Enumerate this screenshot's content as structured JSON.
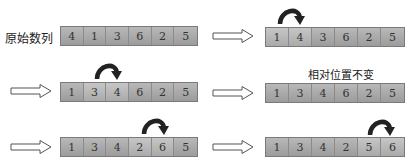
{
  "labels": {
    "original": "原始数列",
    "relative": "相对位置不变"
  },
  "steps": [
    {
      "id": "s0",
      "values": [
        "4",
        "1",
        "3",
        "6",
        "2",
        "5"
      ],
      "swap_arrow_over": null
    },
    {
      "id": "s1",
      "values": [
        "1",
        "4",
        "3",
        "6",
        "2",
        "5"
      ],
      "swap_arrow_over": [
        0,
        1
      ]
    },
    {
      "id": "s2",
      "values": [
        "1",
        "3",
        "4",
        "6",
        "2",
        "5"
      ],
      "swap_arrow_over": [
        1,
        2
      ]
    },
    {
      "id": "s3",
      "values": [
        "1",
        "3",
        "4",
        "6",
        "2",
        "5"
      ],
      "swap_arrow_over": null
    },
    {
      "id": "s4",
      "values": [
        "1",
        "3",
        "4",
        "2",
        "6",
        "5"
      ],
      "swap_arrow_over": [
        3,
        4
      ]
    },
    {
      "id": "s5",
      "values": [
        "1",
        "3",
        "4",
        "2",
        "5",
        "6"
      ],
      "swap_arrow_over": [
        4,
        5
      ]
    }
  ],
  "icons": {
    "step_arrow": "hollow-right-arrow",
    "swap_arrow": "curved-clockwise-arrow"
  },
  "colors": {
    "cell_fill": "#a8a8a8",
    "cell_border": "#7a7a7a",
    "swap_arrow": "#222222",
    "text": "#333333"
  }
}
